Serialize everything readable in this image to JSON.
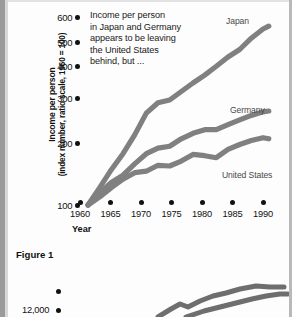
{
  "figure": {
    "caption": "Figure 1",
    "annotation_lines": [
      "Income per person",
      "in Japan and Germany",
      "appears to be leaving",
      "the United States",
      "behind, but ..."
    ],
    "y_axis_title_line1": "Income per person",
    "y_axis_title_line2": "(index number, ratio scale, 1960 = 100)",
    "x_axis_title": "Year",
    "series_labels": {
      "japan": "Japan",
      "germany": "Germany",
      "united_states": "United States"
    },
    "curve_color": "#808080"
  },
  "figure2": {
    "y_tick_label": "12,000"
  },
  "chart_data": {
    "type": "line",
    "title": "Figure 1",
    "xlabel": "Year",
    "ylabel": "Income per person (index number, ratio scale, 1960 = 100)",
    "yscale": "log",
    "ylim": [
      100,
      650
    ],
    "xlim": [
      1958,
      1992
    ],
    "ytick_labels": [
      "100",
      "200",
      "300",
      "400",
      "500",
      "600"
    ],
    "ytick_values": [
      100,
      200,
      300,
      400,
      500,
      600
    ],
    "xtick_labels": [
      "1960",
      "1965",
      "1970",
      "1975",
      "1980",
      "1985",
      "1990"
    ],
    "xtick_values": [
      1960,
      1965,
      1970,
      1975,
      1980,
      1985,
      1990
    ],
    "grid": false,
    "legend": "inline-labels",
    "x": [
      1960,
      1962,
      1964,
      1966,
      1968,
      1970,
      1972,
      1974,
      1976,
      1978,
      1980,
      1982,
      1984,
      1986,
      1988,
      1990,
      1991
    ],
    "series": [
      {
        "name": "Japan",
        "color": "#808080",
        "values": [
          100,
          118,
          140,
          163,
          195,
          240,
          265,
          272,
          295,
          320,
          345,
          375,
          410,
          440,
          490,
          535,
          550
        ]
      },
      {
        "name": "Germany",
        "color": "#808080",
        "values": [
          100,
          112,
          124,
          133,
          148,
          163,
          172,
          175,
          188,
          198,
          205,
          205,
          215,
          225,
          235,
          243,
          245
        ]
      },
      {
        "name": "United States",
        "color": "#808080",
        "values": [
          100,
          108,
          118,
          128,
          136,
          138,
          146,
          145,
          152,
          162,
          160,
          157,
          170,
          178,
          185,
          190,
          188
        ]
      }
    ],
    "annotation": "Income per person in Japan and Germany appears to be leaving the United States behind, but ..."
  }
}
